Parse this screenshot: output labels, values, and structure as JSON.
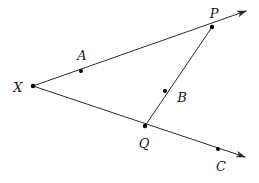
{
  "figure": {
    "kind": "geometry-diagram",
    "background_color": "#ffffff",
    "stroke_color": "#2b2b2b",
    "dot_color": "#000000",
    "label_color": "#1a1a1a",
    "stroke_width": 1,
    "dot_radius": 2,
    "canvas": {
      "width": 259,
      "height": 183
    }
  },
  "points": [
    {
      "id": "X",
      "label": "X",
      "x": 33,
      "y": 86,
      "label_x": 18,
      "label_y": 87,
      "kind": "vertex"
    },
    {
      "id": "A",
      "label": "A",
      "x": 81,
      "y": 71,
      "label_x": 82,
      "label_y": 55,
      "kind": "point-on-ray"
    },
    {
      "id": "P",
      "label": "P",
      "x": 212,
      "y": 27,
      "label_x": 214,
      "label_y": 13,
      "kind": "point-on-ray"
    },
    {
      "id": "B",
      "label": "B",
      "x": 165,
      "y": 91,
      "label_x": 182,
      "label_y": 97,
      "kind": "point-on-segment"
    },
    {
      "id": "Q",
      "label": "Q",
      "x": 145,
      "y": 126,
      "label_x": 144,
      "label_y": 143,
      "kind": "point-on-ray"
    },
    {
      "id": "C",
      "label": "C",
      "x": 218,
      "y": 149,
      "label_x": 221,
      "label_y": 166,
      "kind": "point-on-ray"
    }
  ],
  "rays": [
    {
      "id": "ray-XP",
      "from": "X",
      "through": "P",
      "tip_x": 248,
      "tip_y": 10,
      "arrow": true,
      "x1": 33,
      "y1": 86,
      "x2": 246,
      "y2": 11
    },
    {
      "id": "ray-XC",
      "from": "X",
      "through": "C",
      "tip_x": 247,
      "tip_y": 158,
      "arrow": true,
      "x1": 33,
      "y1": 86,
      "x2": 245,
      "y2": 157
    }
  ],
  "segments": [
    {
      "id": "segment-PQ",
      "from": "P",
      "to": "Q",
      "arrow": false,
      "x1": 212,
      "y1": 27,
      "x2": 145,
      "y2": 126
    }
  ]
}
